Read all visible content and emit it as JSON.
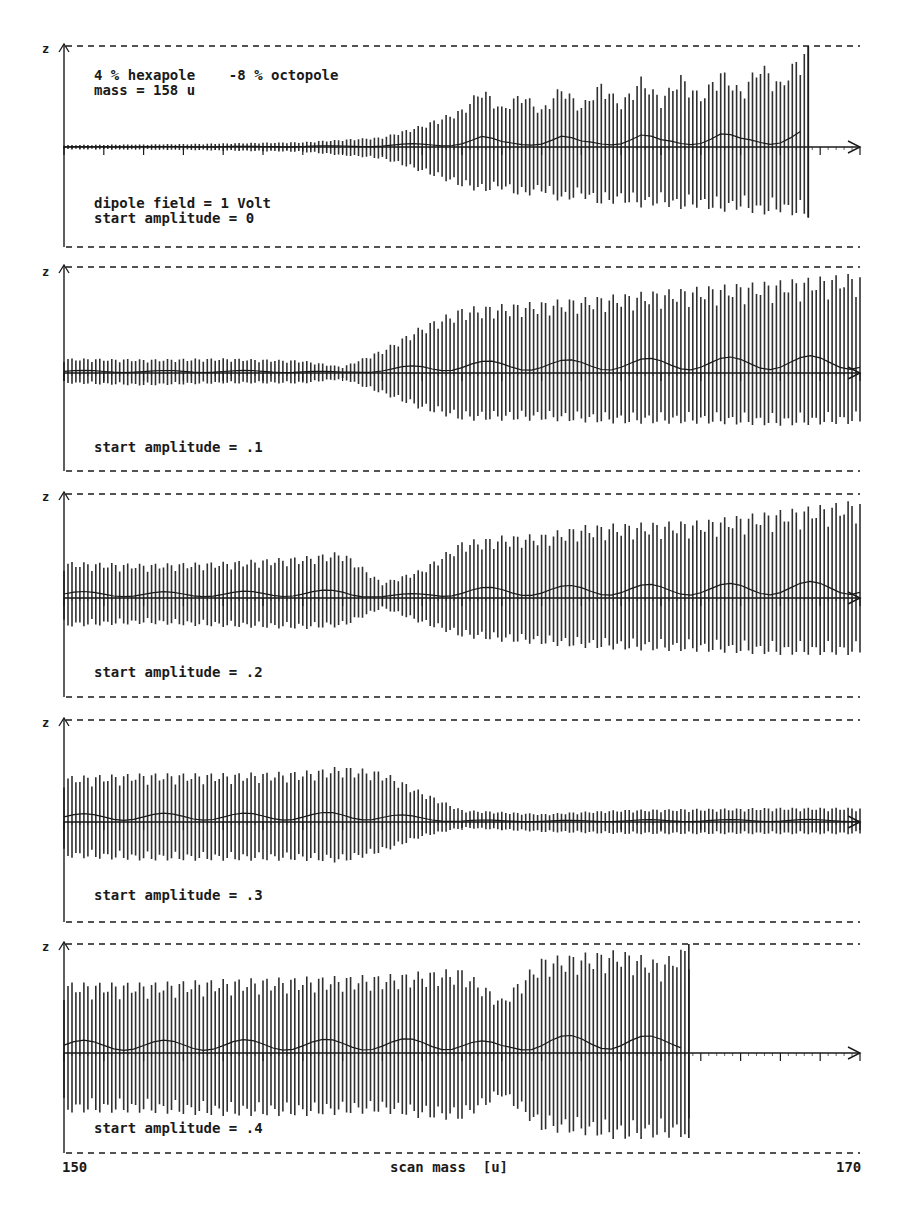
{
  "figure": {
    "x_axis": {
      "label": "scan mass  [u]",
      "min_label": "150",
      "max_label": "170",
      "min": 150,
      "max": 170
    },
    "y_axis_label": "z",
    "colors": {
      "ink": "#1a1a1a",
      "background": "#ffffff"
    }
  },
  "panels": [
    {
      "id": "p1",
      "labels_top": [
        "4 % hexapole    -8 % octopole",
        "mass = 158 u"
      ],
      "labels_bottom": [
        "dipole field = 1 Volt",
        "start amplitude = 0"
      ],
      "start_amplitude": "0"
    },
    {
      "id": "p2",
      "labels_top": [],
      "labels_bottom": [
        "start amplitude = .1"
      ],
      "start_amplitude": ".1"
    },
    {
      "id": "p3",
      "labels_top": [],
      "labels_bottom": [
        "start amplitude = .2"
      ],
      "start_amplitude": ".2"
    },
    {
      "id": "p4",
      "labels_top": [],
      "labels_bottom": [
        "start amplitude = .3"
      ],
      "start_amplitude": ".3"
    },
    {
      "id": "p5",
      "labels_top": [],
      "labels_bottom": [
        "start amplitude = .4"
      ],
      "start_amplitude": ".4"
    }
  ],
  "chart_data": {
    "type": "line",
    "title": "",
    "xlabel": "scan mass [u]",
    "ylabel": "z",
    "xlim": [
      150,
      170
    ],
    "ylim": [
      -1,
      1
    ],
    "grid": false,
    "legend": "none",
    "annotations": [
      "4 % hexapole  -8 % octopole",
      "mass = 158 u",
      "dipole field = 1 Volt"
    ],
    "note": "Ion z-oscillation envelopes (normalized to the dashed boundary = 1) versus scan mass for five start amplitudes; envelopes approximated from the figure.",
    "series": [
      {
        "name": "start amplitude = 0",
        "ejected_at": 168.7,
        "envelope": {
          "x": [
            150,
            153,
            156,
            158,
            159,
            160,
            160.5,
            161,
            161.5,
            162,
            162.5,
            163,
            163.5,
            164,
            164.5,
            165,
            165.5,
            166,
            166.5,
            167,
            167.5,
            168,
            168.5,
            168.7
          ],
          "upper": [
            0.02,
            0.03,
            0.05,
            0.1,
            0.22,
            0.38,
            0.6,
            0.4,
            0.55,
            0.38,
            0.62,
            0.42,
            0.65,
            0.45,
            0.7,
            0.5,
            0.72,
            0.52,
            0.78,
            0.58,
            0.85,
            0.65,
            0.95,
            1.0
          ],
          "lower": [
            -0.02,
            -0.03,
            -0.05,
            -0.12,
            -0.25,
            -0.4,
            -0.45,
            -0.42,
            -0.5,
            -0.45,
            -0.55,
            -0.5,
            -0.58,
            -0.55,
            -0.6,
            -0.58,
            -0.62,
            -0.6,
            -0.65,
            -0.62,
            -0.68,
            -0.65,
            -0.7,
            -0.7
          ]
        }
      },
      {
        "name": "start amplitude = .1",
        "ejected_at": null,
        "envelope": {
          "x": [
            150,
            152,
            154,
            156,
            157,
            158,
            159,
            160,
            162,
            164,
            166,
            168,
            170
          ],
          "upper": [
            0.14,
            0.13,
            0.14,
            0.12,
            0.06,
            0.22,
            0.45,
            0.62,
            0.68,
            0.75,
            0.82,
            0.88,
            0.95
          ],
          "lower": [
            -0.1,
            -0.12,
            -0.1,
            -0.1,
            -0.06,
            -0.2,
            -0.35,
            -0.45,
            -0.45,
            -0.48,
            -0.48,
            -0.5,
            -0.48
          ]
        }
      },
      {
        "name": "start amplitude = .2",
        "ejected_at": null,
        "envelope": {
          "x": [
            150,
            152,
            154,
            156,
            157,
            158,
            159,
            160,
            161,
            162,
            163,
            164,
            166,
            168,
            170
          ],
          "upper": [
            0.35,
            0.33,
            0.35,
            0.4,
            0.45,
            0.15,
            0.28,
            0.55,
            0.6,
            0.62,
            0.7,
            0.72,
            0.75,
            0.85,
            0.95
          ],
          "lower": [
            -0.28,
            -0.25,
            -0.28,
            -0.3,
            -0.28,
            -0.1,
            -0.25,
            -0.38,
            -0.42,
            -0.45,
            -0.48,
            -0.5,
            -0.52,
            -0.55,
            -0.55
          ]
        }
      },
      {
        "name": "start amplitude = .3",
        "ejected_at": null,
        "envelope": {
          "x": [
            150,
            152,
            154,
            156,
            157,
            158,
            159,
            160,
            162,
            164,
            166,
            168,
            170
          ],
          "upper": [
            0.45,
            0.48,
            0.48,
            0.5,
            0.55,
            0.5,
            0.3,
            0.12,
            0.08,
            0.12,
            0.13,
            0.14,
            0.14
          ],
          "lower": [
            -0.35,
            -0.38,
            -0.38,
            -0.38,
            -0.4,
            -0.3,
            -0.15,
            -0.06,
            -0.1,
            -0.12,
            -0.12,
            -0.12,
            -0.12
          ]
        }
      },
      {
        "name": "start amplitude = .4",
        "ejected_at": 165.7,
        "envelope": {
          "x": [
            150,
            152,
            154,
            156,
            158,
            159,
            160,
            161,
            162,
            163,
            164,
            165,
            165.7
          ],
          "upper": [
            0.65,
            0.65,
            0.68,
            0.7,
            0.72,
            0.75,
            0.78,
            0.5,
            0.88,
            0.92,
            0.95,
            0.85,
            1.0
          ],
          "lower": [
            -0.55,
            -0.55,
            -0.58,
            -0.58,
            -0.55,
            -0.6,
            -0.62,
            -0.4,
            -0.72,
            -0.75,
            -0.8,
            -0.78,
            -0.78
          ]
        }
      }
    ]
  }
}
